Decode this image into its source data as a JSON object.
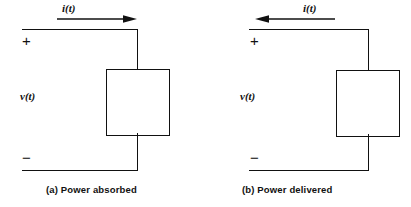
{
  "figure": {
    "stroke_color": "#111111",
    "background_color": "#ffffff"
  },
  "panels": [
    {
      "id": "a",
      "caption": "(a)  Power absorbed",
      "current_label": "i(t)",
      "current_direction": "right",
      "voltage_label": "v(t)",
      "plus_terminal": "+",
      "minus_terminal": "−"
    },
    {
      "id": "b",
      "caption": "(b)  Power delivered",
      "current_label": "i(t)",
      "current_direction": "left",
      "voltage_label": "v(t)",
      "plus_terminal": "+",
      "minus_terminal": "−"
    }
  ]
}
